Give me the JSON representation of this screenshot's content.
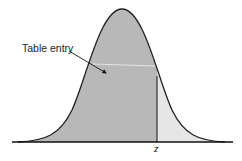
{
  "diagram": {
    "labels": {
      "table_entry": "Table entry",
      "z": "z"
    },
    "colors": {
      "shaded_area": "#b8b8b8",
      "tail_area": "#e6e6e6",
      "curve": "#222222",
      "axis": "#111111"
    },
    "regions": [
      {
        "name": "left-area",
        "description": "Area under curve left of z (table entry)"
      },
      {
        "name": "right-tail",
        "description": "Area under curve right of z"
      }
    ]
  }
}
